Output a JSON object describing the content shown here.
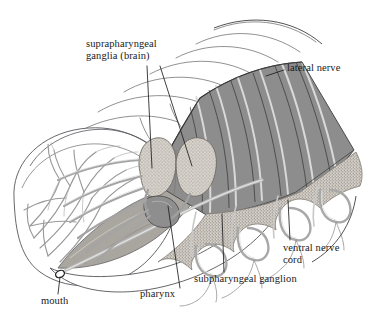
{
  "figure": {
    "view": "cutaway anterior dissection",
    "background_color": "#ffffff",
    "ink_color": "#1a1a1a"
  },
  "palette": {
    "body_wall_dark": "#8d8d8d",
    "body_wall_dark_edge": "#6f6f6f",
    "ganglion_fill": "#cfcbc4",
    "ganglion_stipple": "#9a948c",
    "pharynx_fill": "#b4b0aa",
    "nerve_light": "#d8d8d8",
    "nerve_mid": "#9e9e9e",
    "outline": "#55565a",
    "outline_thin": "#6b6c70",
    "stipple_band": "#b9b5ae",
    "cut_edge": "#3a3a3a"
  },
  "labels": {
    "suprapharyngeal": "suprapharyngeal\nganglia (brain)",
    "lateral_nerve": "lateral nerve",
    "ventral_nerve_cord": "ventral nerve\ncord",
    "subpharyngeal": "subpharyngeal ganglion",
    "pharynx": "pharynx",
    "mouth": "mouth"
  },
  "structures": [
    {
      "id": "brain",
      "name": "suprapharyngeal ganglia (brain)",
      "label": "suprapharyngeal ganglia (brain)"
    },
    {
      "id": "lateral-nerve",
      "name": "lateral nerve",
      "label": "lateral nerve"
    },
    {
      "id": "ventral-cord",
      "name": "ventral nerve cord",
      "label": "ventral nerve cord"
    },
    {
      "id": "subpharyngeal",
      "name": "subpharyngeal ganglion",
      "label": "subpharyngeal ganglion"
    },
    {
      "id": "pharynx",
      "name": "pharynx",
      "label": "pharynx"
    },
    {
      "id": "mouth",
      "name": "mouth",
      "label": "mouth"
    }
  ]
}
